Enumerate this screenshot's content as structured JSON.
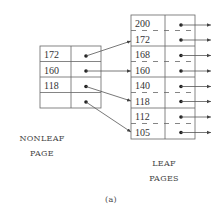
{
  "nonleaf": {
    "label_line1": "NONLEAF",
    "label_line2": "PAGE",
    "keys": [
      "172",
      "160",
      "118",
      ""
    ]
  },
  "leaf": {
    "label_line1": "LEAF",
    "label_line2": "PAGES",
    "pages": [
      {
        "keys": [
          "200",
          "172"
        ]
      },
      {
        "keys": [
          "168",
          "160"
        ]
      },
      {
        "keys": [
          "140",
          "118"
        ]
      },
      {
        "keys": [
          "112",
          "105"
        ]
      }
    ]
  },
  "caption": "(a)",
  "colors": {
    "line": "#555555",
    "dot": "#222222",
    "text": "#333333"
  }
}
